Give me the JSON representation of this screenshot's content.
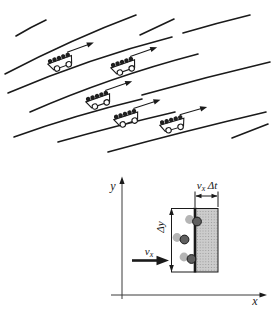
{
  "figure": {
    "top_panel": {
      "content": "molecule-carts-on-streamlines",
      "cart_count": 5,
      "streamline_count": 11
    },
    "bottom_panel": {
      "y_axis_label": "y",
      "x_axis_label": "x",
      "delta_y_label": "Δy",
      "vx_dt_label": {
        "v": "v",
        "sub": "x",
        "rest": "Δt"
      },
      "vx_label": {
        "v": "v",
        "sub": "x"
      },
      "molecule_count": 3,
      "colors": {
        "ink": "#1a1a1a",
        "shaded_fill": "#cccccc",
        "stipple_dot": "#8f8f8f",
        "molecule_dark": "#5f5f5f",
        "molecule_ghost": "#b5b5b5"
      }
    }
  }
}
